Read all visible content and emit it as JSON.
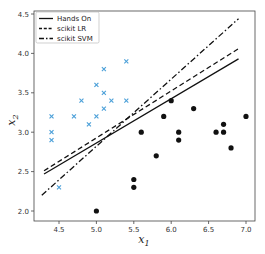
{
  "chart_data": {
    "type": "scatter",
    "title": "",
    "xlabel": "x1",
    "ylabel": "x2",
    "xlim": [
      4.17,
      7.13
    ],
    "ylim": [
      1.87,
      4.55
    ],
    "grid": false,
    "legend_position": "upper left",
    "x_ticks": [
      4.5,
      5.0,
      5.5,
      6.0,
      6.5,
      7.0
    ],
    "x_tick_labels": [
      "4.5",
      "5.0",
      "5.5",
      "6.0",
      "6.5",
      "7.0"
    ],
    "y_ticks": [
      2.0,
      2.5,
      3.0,
      3.5,
      4.0,
      4.5
    ],
    "y_tick_labels": [
      "2.0",
      "2.5",
      "3.0",
      "3.5",
      "4.0",
      "4.5"
    ],
    "series": [
      {
        "name": "class 0",
        "kind": "scatter",
        "marker": "x",
        "color": "#4a9fd8",
        "points": [
          [
            5.4,
            3.9
          ],
          [
            5.1,
            3.8
          ],
          [
            5.0,
            3.6
          ],
          [
            5.1,
            3.5
          ],
          [
            4.8,
            3.4
          ],
          [
            5.2,
            3.4
          ],
          [
            5.4,
            3.4
          ],
          [
            5.1,
            3.3
          ],
          [
            4.4,
            3.2
          ],
          [
            4.7,
            3.2
          ],
          [
            5.0,
            3.2
          ],
          [
            4.9,
            3.1
          ],
          [
            4.4,
            3.0
          ],
          [
            4.4,
            2.9
          ],
          [
            4.5,
            2.3
          ]
        ]
      },
      {
        "name": "class 1",
        "kind": "scatter",
        "marker": "o",
        "color": "#111111",
        "points": [
          [
            6.0,
            3.4
          ],
          [
            6.3,
            3.3
          ],
          [
            5.9,
            3.2
          ],
          [
            7.0,
            3.2
          ],
          [
            5.6,
            3.0
          ],
          [
            6.1,
            3.0
          ],
          [
            6.6,
            3.0
          ],
          [
            6.7,
            3.0
          ],
          [
            6.7,
            3.1
          ],
          [
            6.1,
            2.9
          ],
          [
            6.8,
            2.8
          ],
          [
            5.8,
            2.7
          ],
          [
            5.5,
            2.4
          ],
          [
            5.5,
            2.3
          ],
          [
            5.0,
            2.0
          ]
        ]
      },
      {
        "name": "Hands On",
        "kind": "line",
        "style": "solid",
        "color": "#111111",
        "points": [
          [
            4.3,
            2.47
          ],
          [
            6.9,
            3.93
          ]
        ]
      },
      {
        "name": "scikit LR",
        "kind": "line",
        "style": "dashed",
        "color": "#111111",
        "points": [
          [
            4.3,
            2.51
          ],
          [
            6.9,
            4.06
          ]
        ]
      },
      {
        "name": "scikit SVM",
        "kind": "line",
        "style": "dashdot",
        "color": "#111111",
        "points": [
          [
            4.27,
            2.2
          ],
          [
            6.9,
            4.44
          ]
        ]
      }
    ],
    "legend": [
      "Hands On",
      "scikit LR",
      "scikit SVM"
    ]
  }
}
